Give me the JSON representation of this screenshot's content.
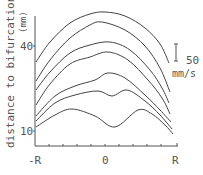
{
  "chart_data": {
    "type": "line",
    "title": "",
    "xlabel": "",
    "ylabel": "distance to bifurcation (mm)",
    "x_tick_labels": [
      "-R",
      "0",
      "R"
    ],
    "y_tick_labels": [
      "40",
      "10"
    ],
    "scale_bar": {
      "value": "50",
      "unit": "mm/s"
    },
    "grid": false,
    "legend": null,
    "x_range": [
      "-R",
      "R"
    ],
    "series": [
      {
        "name": "profile-1",
        "points": [
          [
            36,
            62
          ],
          [
            50,
            42
          ],
          [
            70,
            23
          ],
          [
            90,
            14
          ],
          [
            105,
            12
          ],
          [
            125,
            16
          ],
          [
            145,
            28
          ],
          [
            160,
            44
          ],
          [
            169,
            63
          ]
        ]
      },
      {
        "name": "profile-2",
        "points": [
          [
            36,
            81
          ],
          [
            50,
            60
          ],
          [
            70,
            38
          ],
          [
            90,
            25
          ],
          [
            102,
            22
          ],
          [
            125,
            30
          ],
          [
            145,
            46
          ],
          [
            160,
            68
          ],
          [
            170,
            92
          ]
        ]
      },
      {
        "name": "profile-3",
        "points": [
          [
            36,
            90
          ],
          [
            50,
            72
          ],
          [
            70,
            53
          ],
          [
            90,
            45
          ],
          [
            110,
            42
          ],
          [
            130,
            50
          ],
          [
            150,
            70
          ],
          [
            162,
            88
          ],
          [
            169,
            103
          ]
        ]
      },
      {
        "name": "profile-4",
        "points": [
          [
            36,
            105
          ],
          [
            50,
            84
          ],
          [
            70,
            64
          ],
          [
            90,
            57
          ],
          [
            108,
            52
          ],
          [
            128,
            60
          ],
          [
            148,
            80
          ],
          [
            162,
            98
          ],
          [
            170,
            114
          ]
        ]
      },
      {
        "name": "profile-5",
        "points": [
          [
            36,
            116
          ],
          [
            55,
            96
          ],
          [
            75,
            86
          ],
          [
            95,
            80
          ],
          [
            108,
            73
          ],
          [
            125,
            78
          ],
          [
            145,
            95
          ],
          [
            160,
            110
          ],
          [
            171,
            122
          ]
        ]
      },
      {
        "name": "profile-6",
        "points": [
          [
            36,
            121
          ],
          [
            55,
            103
          ],
          [
            75,
            95
          ],
          [
            98,
            91
          ],
          [
            112,
            96
          ],
          [
            127,
            90
          ],
          [
            145,
            101
          ],
          [
            160,
            115
          ],
          [
            172,
            129
          ]
        ]
      },
      {
        "name": "profile-7",
        "points": [
          [
            36,
            127
          ],
          [
            55,
            115
          ],
          [
            72,
            109
          ],
          [
            95,
            116
          ],
          [
            115,
            127
          ],
          [
            138,
            110
          ],
          [
            152,
            114
          ],
          [
            165,
            125
          ],
          [
            173,
            134
          ]
        ]
      }
    ]
  },
  "labels": {
    "y_axis_title": "distance to bifurcation",
    "y_axis_unit": "(mm)",
    "y_tick_40": "40",
    "y_tick_10": "10",
    "x_tick_left": "-R",
    "x_tick_center": "0",
    "x_tick_right": "R",
    "scale_value": "50",
    "scale_unit": "mm/s"
  }
}
